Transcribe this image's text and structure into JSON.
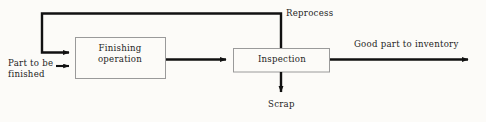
{
  "diagram": {
    "type": "process-flowchart",
    "background_color": "#fcfbf8",
    "line_color": "#111111",
    "box_border_color": "#8d8d8d",
    "text_color": "#1d1d1d",
    "nodes": [
      {
        "id": "finishing",
        "label": "Finishing\noperation",
        "shape": "rectangle",
        "x": 75,
        "y": 37,
        "width": 90,
        "height": 41
      },
      {
        "id": "inspection",
        "label": "Inspection",
        "shape": "rectangle",
        "x": 233,
        "y": 48,
        "width": 97,
        "height": 24
      }
    ],
    "edges": [
      {
        "id": "input",
        "label": "Part to be\nfinished",
        "from": "external-input",
        "to": "finishing",
        "direction": "right"
      },
      {
        "id": "to-inspection",
        "label": "",
        "from": "finishing",
        "to": "inspection",
        "direction": "right"
      },
      {
        "id": "reprocess",
        "label": "Reprocess",
        "from": "inspection",
        "to": "finishing",
        "direction": "feedback-loop"
      },
      {
        "id": "good-part",
        "label": "Good part to inventory",
        "from": "inspection",
        "to": "inventory",
        "direction": "right"
      },
      {
        "id": "scrap",
        "label": "Scrap",
        "from": "inspection",
        "to": "scrap",
        "direction": "down"
      }
    ]
  }
}
